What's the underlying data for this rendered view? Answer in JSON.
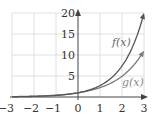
{
  "chart_data": {
    "type": "line",
    "title": "",
    "xlabel": "",
    "ylabel": "",
    "xlim": [
      -3,
      3
    ],
    "ylim": [
      0,
      20
    ],
    "grid": true,
    "x_ticks": [
      "−3",
      "−2",
      "−1",
      "0",
      "1",
      "2",
      "3"
    ],
    "y_ticks": [
      "5",
      "10",
      "15",
      "20"
    ],
    "x": [
      -3,
      -2.5,
      -2,
      -1.5,
      -1,
      -0.5,
      0,
      0.5,
      1,
      1.5,
      2,
      2.5,
      3
    ],
    "series": [
      {
        "name": "f(x)",
        "values": [
          0.05,
          0.08,
          0.14,
          0.22,
          0.37,
          0.61,
          1.0,
          1.65,
          2.72,
          4.48,
          7.39,
          12.18,
          20.0
        ],
        "color": "#555555"
      },
      {
        "name": "g(x)",
        "values": [
          0.09,
          0.14,
          0.2,
          0.3,
          0.45,
          0.67,
          1.0,
          1.49,
          2.23,
          3.32,
          4.95,
          7.39,
          11.0
        ],
        "color": "#777777"
      }
    ],
    "annotations": [
      {
        "text": "f(x)",
        "x": 2.2,
        "y": 13
      },
      {
        "text": "g(x)",
        "x": 2.3,
        "y": 3
      }
    ]
  },
  "labels": {
    "f": "f(x)",
    "g": "g(x)"
  },
  "ticks": {
    "x": [
      "−3",
      "−2",
      "−1",
      "0",
      "1",
      "2",
      "3"
    ],
    "y": [
      "20",
      "15",
      "10",
      "5"
    ]
  }
}
